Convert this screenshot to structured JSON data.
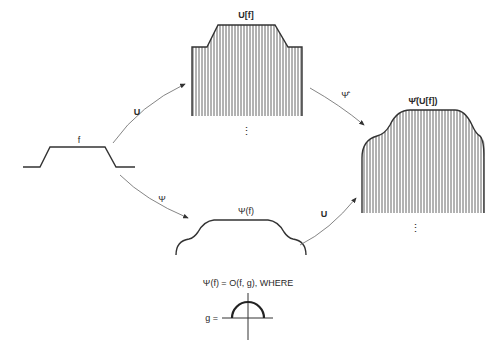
{
  "diagram": {
    "nodes": {
      "f": {
        "label": "f"
      },
      "u_f": {
        "label": "U[f]"
      },
      "psi_f": {
        "label": "Ψ(f)"
      },
      "psi_hat_u_f": {
        "label": "Ψ̂(U[f])"
      }
    },
    "edges": {
      "f_to_u_f": {
        "label": "U"
      },
      "f_to_psi_f": {
        "label": "Ψ"
      },
      "u_f_to_psi_hat": {
        "label": "Ψ̂"
      },
      "psi_f_to_psi_hat": {
        "label": "U"
      }
    },
    "ellipsis": "⋮",
    "formula": {
      "text": "Ψ(f) = O(f, g), WHERE",
      "g_label": "g ="
    }
  }
}
